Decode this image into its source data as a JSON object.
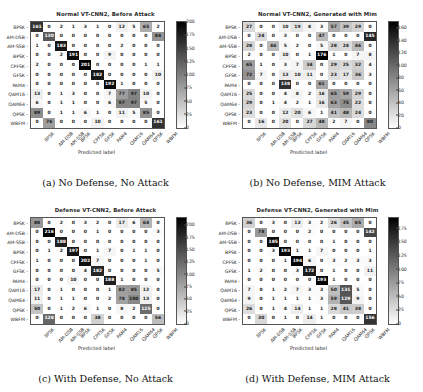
{
  "figure": {
    "class_labels": [
      "8PSK",
      "AM-DSB",
      "AM-SSB",
      "BPSK",
      "CPFSK",
      "GFSK",
      "PAM4",
      "QAM16",
      "QAM64",
      "QPSK",
      "WBFM"
    ],
    "xlabel": "Predicted label",
    "ylabel": "True label",
    "cmap_low": "#ffffff",
    "cmap_high": "#000000"
  },
  "chart_data": [
    {
      "type": "heatmap",
      "panel": "a",
      "title": "Normal VT-CNN2, Before Attack",
      "caption": "(a) No Defense, No Attack",
      "xlabel": "Predicted label",
      "ylabel": "True label",
      "categories": [
        "8PSK",
        "AM-DSB",
        "AM-SSB",
        "BPSK",
        "CPFSK",
        "GFSK",
        "PAM4",
        "QAM16",
        "QAM64",
        "QPSK",
        "WBFM"
      ],
      "colorbar_ticks": [
        0,
        25,
        50,
        75,
        100,
        125,
        150,
        175,
        200
      ],
      "vmin": 0,
      "vmax": 200,
      "values": [
        [
          161,
          0,
          2,
          1,
          3,
          1,
          0,
          12,
          5,
          65,
          2
        ],
        [
          0,
          130,
          0,
          0,
          0,
          0,
          0,
          0,
          0,
          0,
          84
        ],
        [
          1,
          0,
          183,
          0,
          0,
          0,
          0,
          2,
          0,
          0,
          0
        ],
        [
          0,
          0,
          2,
          191,
          0,
          0,
          9,
          0,
          0,
          0,
          0
        ],
        [
          2,
          0,
          0,
          0,
          201,
          0,
          0,
          0,
          0,
          1,
          1
        ],
        [
          0,
          0,
          0,
          0,
          0,
          182,
          0,
          0,
          0,
          0,
          10
        ],
        [
          0,
          0,
          0,
          0,
          0,
          0,
          192,
          1,
          0,
          0,
          0
        ],
        [
          13,
          0,
          1,
          3,
          0,
          0,
          7,
          77,
          97,
          10,
          0
        ],
        [
          6,
          0,
          1,
          1,
          0,
          0,
          6,
          97,
          97,
          5,
          0
        ],
        [
          89,
          0,
          1,
          1,
          6,
          1,
          0,
          11,
          5,
          85,
          0
        ],
        [
          0,
          76,
          0,
          0,
          0,
          10,
          0,
          0,
          0,
          0,
          161
        ]
      ]
    },
    {
      "type": "heatmap",
      "panel": "b",
      "title": "Normal VT-CNN2, Generated with Mim",
      "caption": "(b) No Defense, MIM Attack",
      "xlabel": "Predicted label",
      "ylabel": "True label",
      "categories": [
        "8PSK",
        "AM-DSB",
        "AM-SSB",
        "BPSK",
        "CPFSK",
        "GFSK",
        "PAM4",
        "QAM16",
        "QAM64",
        "QPSK",
        "WBFM"
      ],
      "colorbar_ticks": [
        0,
        20,
        40,
        60,
        80,
        100,
        120,
        140,
        160
      ],
      "vmin": 0,
      "vmax": 170,
      "values": [
        [
          27,
          0,
          0,
          10,
          19,
          8,
          3,
          57,
          39,
          29,
          0
        ],
        [
          0,
          24,
          0,
          3,
          0,
          0,
          47,
          0,
          0,
          0,
          145
        ],
        [
          28,
          0,
          46,
          5,
          2,
          0,
          5,
          28,
          24,
          46,
          0
        ],
        [
          2,
          0,
          0,
          10,
          0,
          1,
          176,
          1,
          0,
          7,
          8
        ],
        [
          65,
          1,
          0,
          3,
          7,
          34,
          0,
          29,
          25,
          32,
          4
        ],
        [
          72,
          7,
          0,
          13,
          10,
          11,
          0,
          23,
          17,
          36,
          3
        ],
        [
          0,
          0,
          0,
          138,
          0,
          0,
          61,
          0,
          0,
          0,
          0
        ],
        [
          25,
          0,
          0,
          4,
          8,
          2,
          16,
          65,
          59,
          29,
          0
        ],
        [
          29,
          0,
          1,
          4,
          2,
          1,
          16,
          63,
          75,
          22,
          0
        ],
        [
          23,
          0,
          0,
          12,
          20,
          6,
          1,
          41,
          48,
          24,
          0
        ],
        [
          0,
          16,
          0,
          20,
          0,
          27,
          48,
          2,
          7,
          0,
          80
        ]
      ]
    },
    {
      "type": "heatmap",
      "panel": "c",
      "title": "Defense VT-CNN2, Before Attack",
      "caption": "(c) With Defense, No Attack",
      "xlabel": "Predicted label",
      "ylabel": "True label",
      "categories": [
        "8PSK",
        "AM-DSB",
        "AM-SSB",
        "BPSK",
        "CPFSK",
        "GFSK",
        "PAM4",
        "QAM16",
        "QAM64",
        "QPSK",
        "WBFM"
      ],
      "colorbar_ticks": [
        0,
        25,
        50,
        75,
        100,
        125,
        150,
        175,
        200
      ],
      "vmin": 0,
      "vmax": 215,
      "values": [
        [
          88,
          0,
          2,
          0,
          3,
          2,
          0,
          17,
          6,
          64,
          0
        ],
        [
          0,
          216,
          0,
          0,
          0,
          1,
          0,
          0,
          0,
          0,
          3
        ],
        [
          0,
          0,
          188,
          0,
          0,
          0,
          0,
          0,
          0,
          0,
          0
        ],
        [
          0,
          1,
          2,
          197,
          0,
          1,
          7,
          0,
          1,
          1,
          0
        ],
        [
          1,
          0,
          0,
          0,
          202,
          7,
          0,
          0,
          0,
          1,
          0
        ],
        [
          0,
          0,
          0,
          0,
          4,
          182,
          0,
          0,
          0,
          0,
          5
        ],
        [
          0,
          0,
          0,
          10,
          0,
          0,
          188,
          1,
          0,
          0,
          0
        ],
        [
          17,
          0,
          1,
          0,
          0,
          0,
          1,
          82,
          85,
          12,
          0
        ],
        [
          11,
          0,
          1,
          1,
          0,
          0,
          2,
          78,
          100,
          13,
          0
        ],
        [
          50,
          0,
          1,
          2,
          6,
          1,
          0,
          8,
          2,
          125,
          0
        ],
        [
          0,
          128,
          0,
          0,
          0,
          38,
          0,
          0,
          0,
          0,
          56
        ]
      ]
    },
    {
      "type": "heatmap",
      "panel": "d",
      "title": "Defense VT-CNN2, Generated with Mim",
      "caption": "(d) With Defense, MIM Attack",
      "xlabel": "Predicted label",
      "ylabel": "True label",
      "categories": [
        "8PSK",
        "AM-DSB",
        "AM-SSB",
        "BPSK",
        "CPFSK",
        "GFSK",
        "PAM4",
        "QAM16",
        "QAM64",
        "QPSK",
        "WBFM"
      ],
      "colorbar_ticks": [
        0,
        25,
        50,
        75,
        100,
        125,
        150,
        175
      ],
      "vmin": 0,
      "vmax": 195,
      "values": [
        [
          36,
          0,
          3,
          0,
          13,
          3,
          2,
          26,
          45,
          65,
          0
        ],
        [
          0,
          78,
          0,
          0,
          0,
          2,
          0,
          0,
          0,
          0,
          142
        ],
        [
          0,
          0,
          185,
          0,
          0,
          0,
          0,
          1,
          0,
          0,
          0
        ],
        [
          0,
          0,
          3,
          193,
          1,
          1,
          7,
          0,
          0,
          0,
          1
        ],
        [
          0,
          0,
          0,
          1,
          194,
          6,
          0,
          3,
          2,
          3,
          3
        ],
        [
          1,
          2,
          0,
          0,
          3,
          172,
          0,
          1,
          0,
          0,
          11
        ],
        [
          0,
          0,
          0,
          0,
          0,
          0,
          193,
          1,
          0,
          0,
          0
        ],
        [
          7,
          0,
          1,
          2,
          7,
          3,
          3,
          50,
          131,
          5,
          0
        ],
        [
          9,
          0,
          1,
          1,
          1,
          1,
          3,
          59,
          129,
          9,
          0
        ],
        [
          26,
          0,
          1,
          4,
          14,
          1,
          1,
          28,
          41,
          38,
          0
        ],
        [
          0,
          30,
          0,
          1,
          0,
          14,
          1,
          0,
          0,
          0,
          156
        ]
      ]
    }
  ]
}
